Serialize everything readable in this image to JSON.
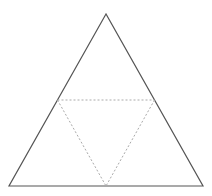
{
  "diagram": {
    "type": "triangle-subdivision",
    "outer_triangle": {
      "vertices": {
        "apex": [
          106,
          14
        ],
        "bottom_left": [
          9,
          186
        ],
        "bottom_right": [
          203,
          186
        ]
      },
      "stroke": "#555555",
      "stroke_width": 1.2,
      "style": "solid"
    },
    "midpoint_triangle": {
      "vertices": {
        "left_mid": [
          57.5,
          100
        ],
        "right_mid": [
          154.5,
          100
        ],
        "bottom_mid": [
          106,
          186
        ]
      },
      "stroke": "#aaaaaa",
      "stroke_width": 1,
      "style": "dotted"
    },
    "background": "#ffffff"
  }
}
